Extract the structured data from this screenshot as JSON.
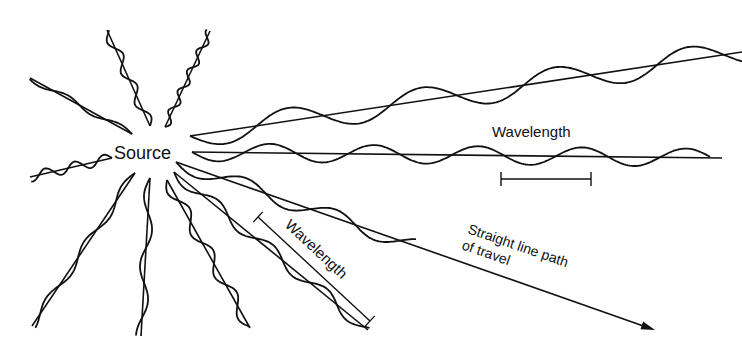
{
  "diagram": {
    "type": "wave-propagation",
    "colors": {
      "ink": "#111111",
      "background": "#ffffff"
    },
    "source": {
      "label": "Source",
      "x": 155,
      "y": 157
    },
    "labels": {
      "wavelength_horizontal": "Wavelength",
      "wavelength_diagonal": "Wavelength",
      "path_line1": "Straight line path",
      "path_line2": "of travel"
    },
    "rays": [
      {
        "name": "ray-upper-right",
        "x1": 190,
        "y1": 136,
        "x2": 742,
        "y2": 52,
        "wave_end": 1.0,
        "wavelength": 135,
        "amplitude": 13
      },
      {
        "name": "ray-horizontal",
        "x1": 192,
        "y1": 152,
        "x2": 722,
        "y2": 158,
        "wave_end": 0.98,
        "wavelength": 104,
        "amplitude": 9
      },
      {
        "name": "ray-travel-arrow",
        "x1": 176,
        "y1": 162,
        "x2": 655,
        "y2": 330,
        "wave_end": 0.5,
        "wavelength": 95,
        "amplitude": 8
      },
      {
        "name": "ray-down-right-long",
        "x1": 174,
        "y1": 172,
        "x2": 368,
        "y2": 330,
        "wave_end": 1.0,
        "wavelength": 70,
        "amplitude": 6
      },
      {
        "name": "ray-down-right",
        "x1": 167,
        "y1": 180,
        "x2": 250,
        "y2": 328,
        "wave_end": 1.0,
        "wavelength": 48,
        "amplitude": 6
      },
      {
        "name": "ray-down",
        "x1": 150,
        "y1": 178,
        "x2": 141,
        "y2": 336,
        "wave_end": 1.0,
        "wavelength": 70,
        "amplitude": 5
      },
      {
        "name": "ray-down-left",
        "x1": 135,
        "y1": 173,
        "x2": 32,
        "y2": 326,
        "wave_end": 1.0,
        "wavelength": 68,
        "amplitude": 4
      },
      {
        "name": "ray-left",
        "x1": 112,
        "y1": 158,
        "x2": 30,
        "y2": 177,
        "wave_end": 1.0,
        "wavelength": 30,
        "amplitude": 5
      },
      {
        "name": "ray-upper-left",
        "x1": 132,
        "y1": 134,
        "x2": 30,
        "y2": 78,
        "wave_end": 1.0,
        "wavelength": 60,
        "amplitude": 3
      },
      {
        "name": "ray-up",
        "x1": 150,
        "y1": 126,
        "x2": 107,
        "y2": 30,
        "wave_end": 1.0,
        "wavelength": 34,
        "amplitude": 5
      },
      {
        "name": "ray-up-right",
        "x1": 165,
        "y1": 127,
        "x2": 210,
        "y2": 31,
        "wave_end": 1.0,
        "wavelength": 22,
        "amplitude": 4
      }
    ],
    "wavelength_bar_horizontal": {
      "x1": 501,
      "x2": 591,
      "y": 179,
      "tick": 7
    },
    "wavelength_bar_diagonal": {
      "x1": 258,
      "y1": 217,
      "x2": 370,
      "y2": 321,
      "tick": 7
    }
  }
}
